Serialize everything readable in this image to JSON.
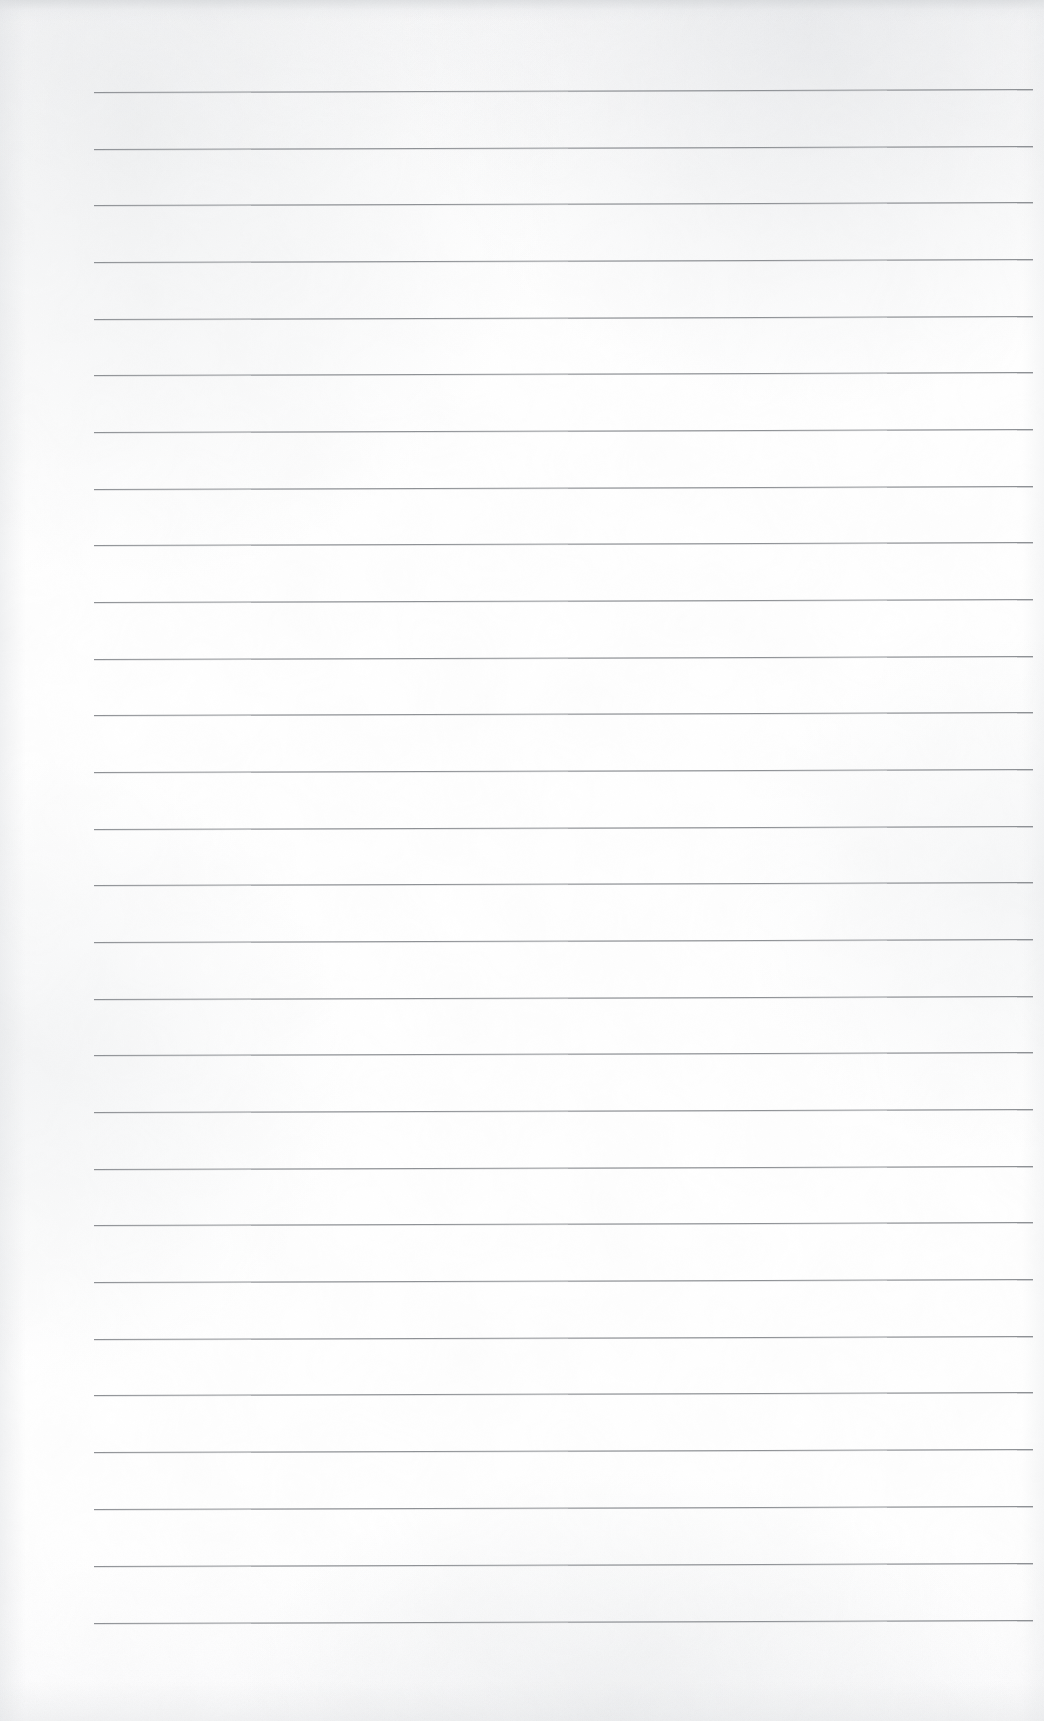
{
  "document": {
    "kind": "scanned-lined-notepad-page",
    "title": "Blank ruled notepad page",
    "page_width": 1044,
    "page_height": 1721,
    "background_color": "#ffffff",
    "paper_tint": "#fbfbfc",
    "has_text_content": false,
    "written_content": "",
    "visible_text": ""
  },
  "ruling": {
    "line_color": "#8e9195",
    "line_thickness_px": 1,
    "line_count": 28,
    "left_margin_px": 94,
    "right_margin_px": 1033,
    "line_length_px": 939,
    "first_line_y_px": 92,
    "line_spacing_px": 56.7,
    "last_line_y_px": 1623,
    "skew_degrees": -0.18,
    "lines": [
      {
        "index": 1,
        "y": 92
      },
      {
        "index": 2,
        "y": 149
      },
      {
        "index": 3,
        "y": 205
      },
      {
        "index": 4,
        "y": 262
      },
      {
        "index": 5,
        "y": 319
      },
      {
        "index": 6,
        "y": 375
      },
      {
        "index": 7,
        "y": 432
      },
      {
        "index": 8,
        "y": 489
      },
      {
        "index": 9,
        "y": 545
      },
      {
        "index": 10,
        "y": 602
      },
      {
        "index": 11,
        "y": 659
      },
      {
        "index": 12,
        "y": 715
      },
      {
        "index": 13,
        "y": 772
      },
      {
        "index": 14,
        "y": 829
      },
      {
        "index": 15,
        "y": 885
      },
      {
        "index": 16,
        "y": 942
      },
      {
        "index": 17,
        "y": 999
      },
      {
        "index": 18,
        "y": 1055
      },
      {
        "index": 19,
        "y": 1112
      },
      {
        "index": 20,
        "y": 1169
      },
      {
        "index": 21,
        "y": 1225
      },
      {
        "index": 22,
        "y": 1282
      },
      {
        "index": 23,
        "y": 1339
      },
      {
        "index": 24,
        "y": 1395
      },
      {
        "index": 25,
        "y": 1452
      },
      {
        "index": 26,
        "y": 1509
      },
      {
        "index": 27,
        "y": 1566
      },
      {
        "index": 28,
        "y": 1623
      }
    ]
  },
  "margins": {
    "top_blank_px": 92,
    "bottom_blank_px": 98,
    "left_blank_px": 94,
    "right_blank_px": 11
  },
  "scan_artifacts": {
    "top_edge_shadow": true,
    "left_edge_shadow": true,
    "bottom_edge_speckle": true,
    "grain_opacity": 0.5,
    "speckle_color": "#e6e8ea"
  }
}
